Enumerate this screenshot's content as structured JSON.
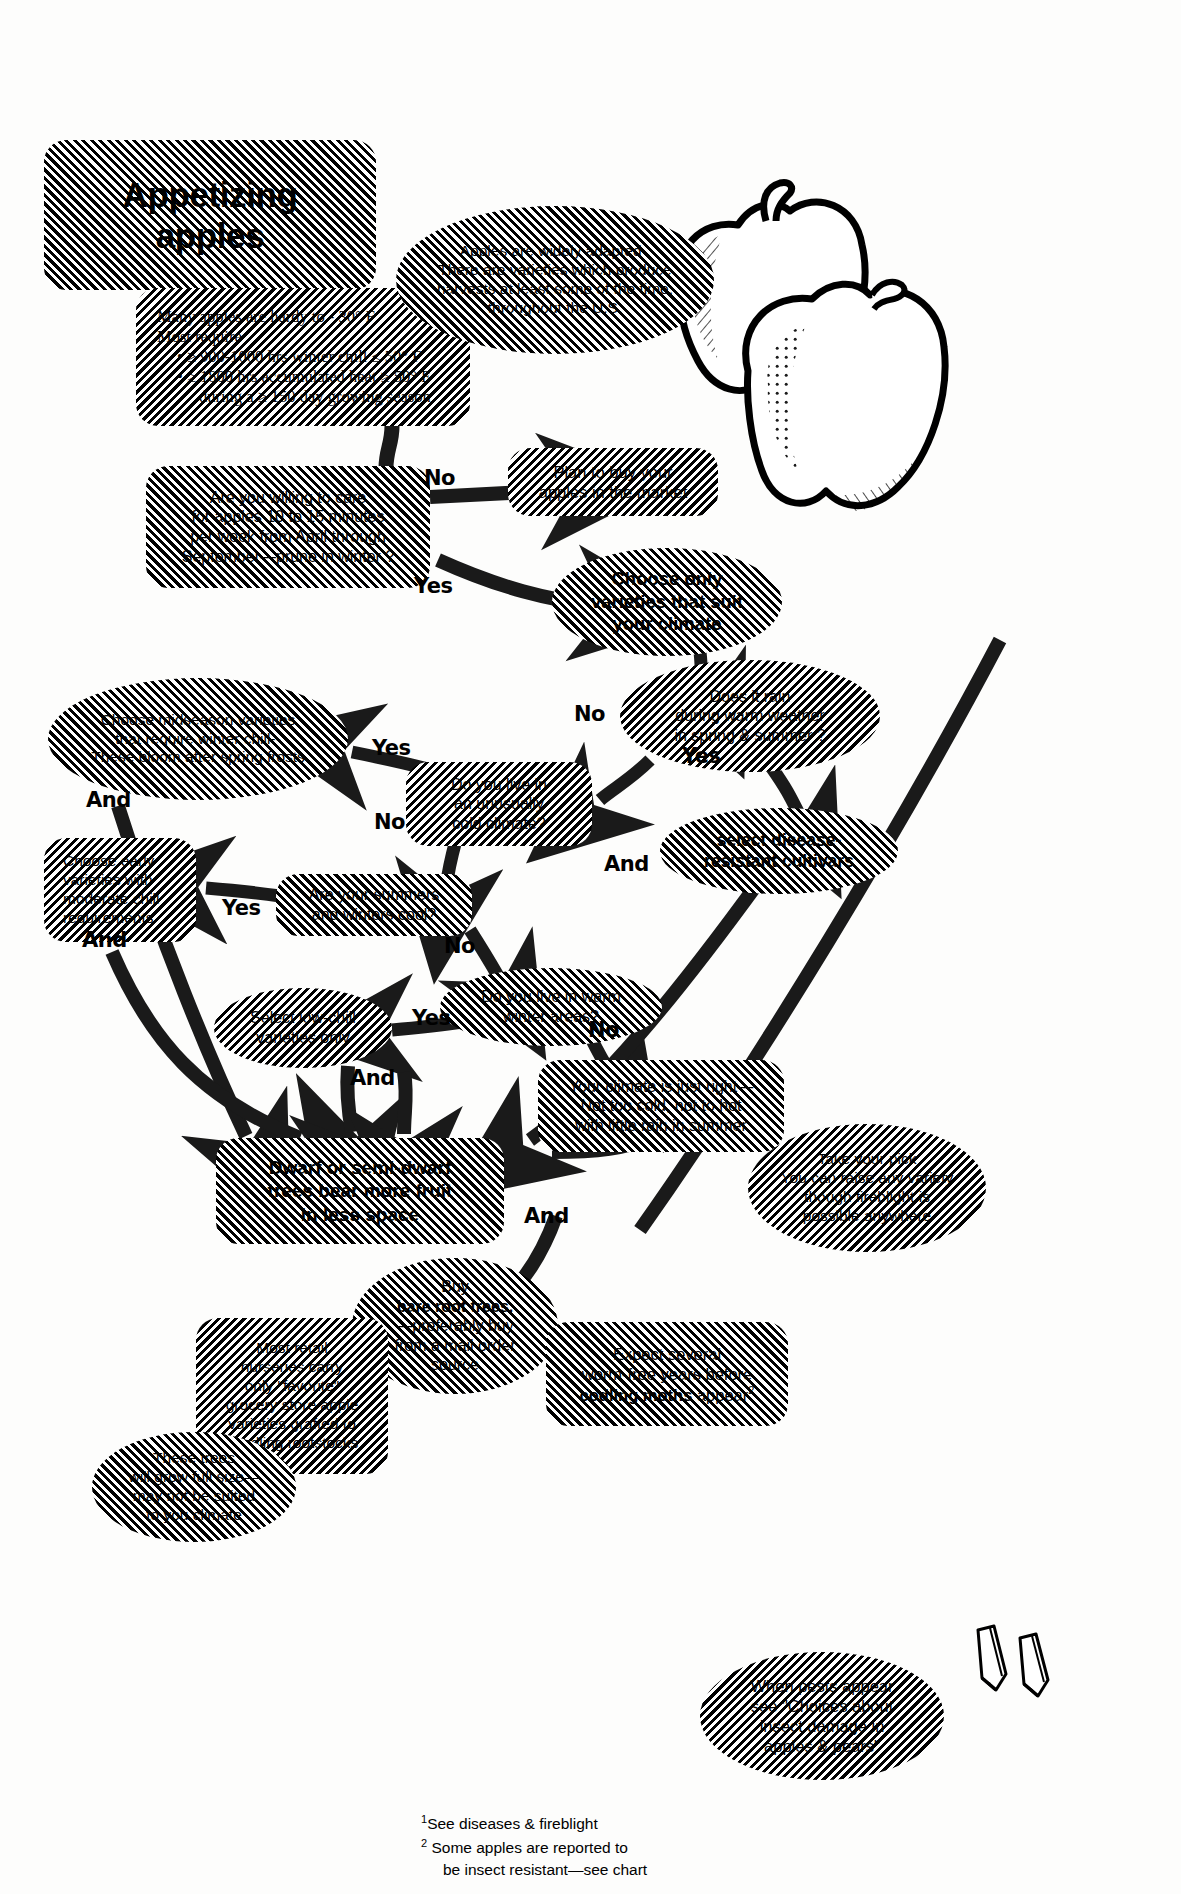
{
  "nodes": {
    "title_box": {
      "label": "Appetizing apples"
    },
    "hardiness": {
      "line1": "Many apples are hardy  to  - 30° F",
      "line2": "Most require",
      "bullet1": "• ≥ 900-1000 hrs winter chill ≤ 50° F",
      "bullet2": "• ≥ 1800 hrs accumulated heat ≥ 50° F",
      "bullet2b": "during a ≥ 150 day growing season"
    },
    "widely_adapted": {
      "text": "Apples are widely adapted .\nThere are varieties which produce\nharvests at least some of the time,\nthroughout the U.S."
    },
    "care_question": {
      "text": "Are you willing to care\nfor apples 10 to 15 minutes\nper week from April through\nSeptember—prune in winter ?"
    },
    "buy_market": {
      "text": "Plan to buy your\napples in the market"
    },
    "choose_climate": {
      "text": "Choose only\nvarieties that suit\nyour climate"
    },
    "rain_question": {
      "text": "Does it rain\nduring warm weather\nin spring & summer ?"
    },
    "disease_resistant": {
      "text": "select disease-\nresistant cultivars"
    },
    "cold_climate_question": {
      "text": "Do you live in\nan unusually\ncold climate?"
    },
    "midseason": {
      "text": "Choose midseason varieties\nthat require winter chill--\nThese bloom after spring frosts"
    },
    "cool_question": {
      "text": "Are your summers\nand winters cool?"
    },
    "early_varieties": {
      "text": "Choose early\nvarieties with\nmoderate chill\nrequirements"
    },
    "warm_winter_question": {
      "text": "Do you live in warm\nwinter areas?"
    },
    "low_chill": {
      "text": "Select low-chill\nvarieties only"
    },
    "just_right": {
      "text": "Your climate is just right—\nNot too cold, not to hot\nwith little rain in summer"
    },
    "take_your_pick": {
      "text": "Take your pick\nYou can raise any variety\nthough  fireblight is\npossible anywhere"
    },
    "dwarf": {
      "text": "Dwarf or semi-dwarf\ntrees bear more fruit\nin less space"
    },
    "bare_root": {
      "line1": "Buy",
      "line2": "bare root trees.",
      "line3": "—preferably buy",
      "line4": "from a mail order",
      "line5": "source"
    },
    "retail_nurseries": {
      "text": "Most retail\nnurseries carry\nonly \"favorite\"\ngrocery store apple\nvarieties grafted to\nseedling rootstocks"
    },
    "full_size": {
      "text": "These trees\nwill grow full size—\nmay not be suited\nto you climate"
    },
    "codling": {
      "line1": "Expect several",
      "line2": "worm-free years before",
      "line3_bold": "codling moths",
      "line3_rest": " appear",
      "sup": "2"
    },
    "pests": {
      "text": "When pests appear\nsee \"Choices about\ninsect damage in\napples & pears\""
    }
  },
  "edge_labels": [
    {
      "id": "care-no",
      "text": "No"
    },
    {
      "id": "care-yes",
      "text": "Yes"
    },
    {
      "id": "rain-no",
      "text": "No"
    },
    {
      "id": "rain-yes",
      "text": "Yes"
    },
    {
      "id": "cold-yes",
      "text": "Yes"
    },
    {
      "id": "cold-no",
      "text": "No"
    },
    {
      "id": "cool-yes",
      "text": "Yes"
    },
    {
      "id": "cool-no",
      "text": "No"
    },
    {
      "id": "warm-yes",
      "text": "Yes"
    },
    {
      "id": "warm-no",
      "text": "No"
    },
    {
      "id": "and-1",
      "text": "And"
    },
    {
      "id": "and-2",
      "text": "And"
    },
    {
      "id": "and-3",
      "text": "And"
    },
    {
      "id": "and-4",
      "text": "And"
    },
    {
      "id": "and-5",
      "text": "And"
    }
  ],
  "footnotes": {
    "sup1": "1",
    "note1": "See diseases &  fireblight",
    "sup2": "2",
    "note2a": "Some apples are reported to",
    "note2b": "be insect resistant—see chart"
  },
  "icons": {
    "apples": "apple-illustration",
    "pencils": "pencil-illustration"
  },
  "colors": {
    "ink": "#000000",
    "paper": "#fdfdfc"
  }
}
